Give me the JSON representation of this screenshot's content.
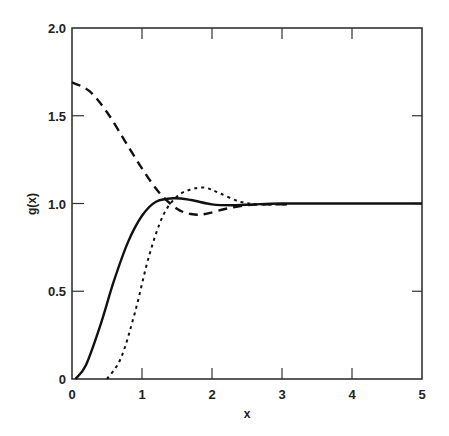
{
  "chart_data": {
    "type": "line",
    "title": "",
    "xlabel": "x",
    "ylabel": "g(x)",
    "xlim": [
      0,
      5
    ],
    "ylim": [
      0,
      2.0
    ],
    "grid": false,
    "legend": null,
    "x_ticks": [
      "0",
      "1",
      "2",
      "3",
      "4",
      "5"
    ],
    "y_ticks": [
      "0",
      "0.5",
      "1.0",
      "1.5",
      "2.0"
    ],
    "series": [
      {
        "name": "solid",
        "style": "solid",
        "points": [
          [
            0.05,
            0
          ],
          [
            0.2,
            0.08
          ],
          [
            0.4,
            0.3
          ],
          [
            0.6,
            0.56
          ],
          [
            0.8,
            0.78
          ],
          [
            1.0,
            0.93
          ],
          [
            1.2,
            1.01
          ],
          [
            1.45,
            1.03
          ],
          [
            1.7,
            1.02
          ],
          [
            2.0,
            0.995
          ],
          [
            2.3,
            0.99
          ],
          [
            2.6,
            0.995
          ],
          [
            3.0,
            1.0
          ],
          [
            4.0,
            1.0
          ],
          [
            5.0,
            1.0
          ]
        ]
      },
      {
        "name": "dashed",
        "style": "dashed",
        "points": [
          [
            0,
            1.69
          ],
          [
            0.25,
            1.64
          ],
          [
            0.5,
            1.52
          ],
          [
            0.75,
            1.36
          ],
          [
            1.0,
            1.2
          ],
          [
            1.25,
            1.06
          ],
          [
            1.5,
            0.97
          ],
          [
            1.7,
            0.94
          ],
          [
            1.9,
            0.94
          ],
          [
            2.2,
            0.97
          ],
          [
            2.5,
            0.99
          ],
          [
            2.8,
            0.995
          ],
          [
            3.1,
            0.995
          ]
        ]
      },
      {
        "name": "dotted",
        "style": "dotted",
        "points": [
          [
            0.5,
            0
          ],
          [
            0.7,
            0.12
          ],
          [
            0.9,
            0.38
          ],
          [
            1.1,
            0.7
          ],
          [
            1.3,
            0.93
          ],
          [
            1.5,
            1.04
          ],
          [
            1.7,
            1.08
          ],
          [
            1.9,
            1.09
          ],
          [
            2.1,
            1.06
          ],
          [
            2.4,
            1.01
          ],
          [
            2.7,
            0.995
          ],
          [
            3.1,
            0.995
          ]
        ]
      }
    ]
  }
}
